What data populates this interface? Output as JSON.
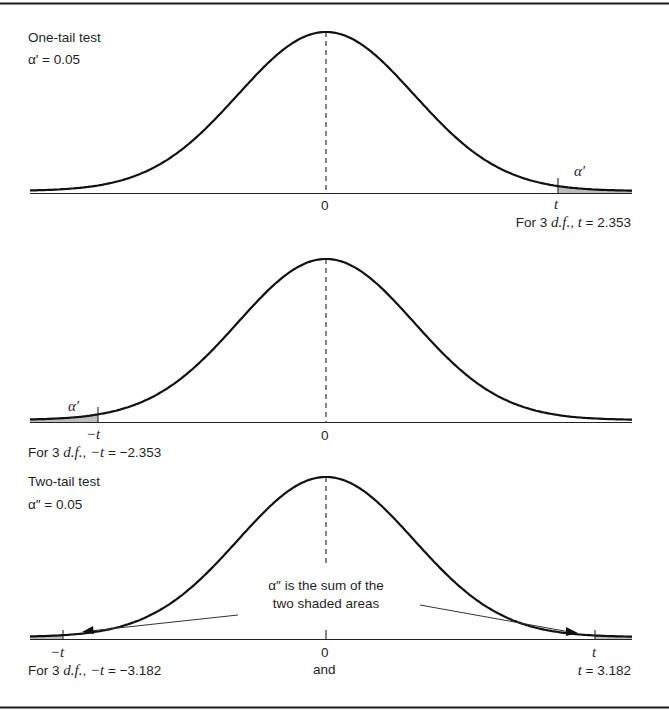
{
  "figure": {
    "border_color": "#1a1a1a",
    "curve_color": "#111111",
    "shade_color": "#b8b8b8",
    "annotation_line_color": "#333333"
  },
  "panels": [
    {
      "id": "one-tail-right",
      "title": "One-tail test",
      "alpha_label": "α′ = 0.05",
      "tail_alpha_symbol": "α′",
      "zero_label": "0",
      "tick_label": "t",
      "caption_prefix": "For 3 ",
      "caption_df": "d.f.",
      "caption_mid": ", ",
      "caption_var": "t",
      "caption_value": " = 2.353"
    },
    {
      "id": "one-tail-left",
      "tail_alpha_symbol": "α′",
      "zero_label": "0",
      "tick_label": "−t",
      "caption_prefix": "For 3 ",
      "caption_df": "d.f.",
      "caption_mid": ", ",
      "caption_var": "−t",
      "caption_value": " = −2.353"
    },
    {
      "id": "two-tail",
      "title": "Two-tail test",
      "alpha_label": "α″ = 0.05",
      "annotation_line1": "α″ is the sum of the",
      "annotation_line2": "two shaded areas",
      "zero_label": "0",
      "left_tick_label": "−t",
      "right_tick_label": "t",
      "caption_left_prefix": "For 3 ",
      "caption_left_df": "d.f.",
      "caption_left_mid": ", ",
      "caption_left_var": "−t",
      "caption_left_value": " = −3.182",
      "caption_and": "and",
      "caption_right_var": "t",
      "caption_right_value": " = 3.182"
    }
  ],
  "chart_data": {
    "type": "diagram",
    "distribution": "Student t",
    "degrees_of_freedom": 3,
    "panels": [
      {
        "test": "one-tail (right)",
        "alpha": 0.05,
        "critical_value": 2.353,
        "shaded": "right tail beyond t"
      },
      {
        "test": "one-tail (left)",
        "alpha": 0.05,
        "critical_value": -2.353,
        "shaded": "left tail beyond -t"
      },
      {
        "test": "two-tail",
        "alpha": 0.05,
        "critical_values": [
          -3.182,
          3.182
        ],
        "shaded": "both tails beyond ±t"
      }
    ]
  }
}
